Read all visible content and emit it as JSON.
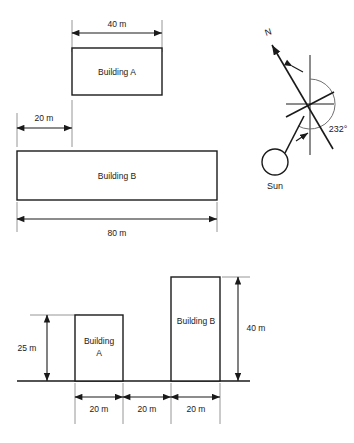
{
  "figure": {
    "title": "",
    "views": {
      "plan": {
        "name": "plan-view",
        "buildings": [
          {
            "id": "building-a",
            "label": "Building A",
            "width_label": "40 m",
            "x": 72,
            "y": 48,
            "w": 90,
            "h": 47
          },
          {
            "id": "building-b",
            "label": "Building B",
            "width_label": "80 m",
            "x": 17,
            "y": 151,
            "w": 200,
            "h": 49
          }
        ],
        "dimensions": [
          {
            "id": "plan-dim-40m",
            "label": "40 m",
            "x1": 72,
            "x2": 162,
            "y": 28
          },
          {
            "id": "plan-dim-offset-20m",
            "label": "20 m",
            "x1": 17,
            "x2": 72,
            "y": 128
          },
          {
            "id": "plan-dim-80m",
            "label": "80 m",
            "x1": 17,
            "x2": 217,
            "y": 222
          }
        ]
      },
      "elevation": {
        "name": "elevation-view",
        "ground_label": "",
        "ground": {
          "x1": 17,
          "x2": 250,
          "y": 381
        },
        "buildings": [
          {
            "id": "building-a-elev",
            "label_line1": "Building",
            "label_line2": "A",
            "height_label": "25 m",
            "x": 75,
            "y": 315,
            "w": 48,
            "h": 66
          },
          {
            "id": "building-b-elev",
            "label_line1": "Building B",
            "label_line2": "",
            "height_label": "40 m",
            "x": 171,
            "y": 277,
            "w": 49,
            "h": 104
          }
        ],
        "height_dims": [
          {
            "id": "elev-dim-25m",
            "label": "25 m",
            "x": 47,
            "y1": 315,
            "y2": 381
          },
          {
            "id": "elev-dim-40m",
            "label": "40 m",
            "x": 238,
            "y1": 277,
            "y2": 381
          }
        ],
        "width_dims": [
          {
            "id": "elev-dim-width-a",
            "label": "20 m",
            "x1": 75,
            "x2": 123,
            "y": 404
          },
          {
            "id": "elev-dim-gap",
            "label": "20 m",
            "x1": 123,
            "x2": 171,
            "y": 404
          },
          {
            "id": "elev-dim-width-b",
            "label": "20 m",
            "x1": 171,
            "x2": 220,
            "y": 404
          }
        ]
      },
      "compass": {
        "name": "compass-sun-diagram",
        "north_label": "N",
        "sun_label": "Sun",
        "angle_label": "232°",
        "center": {
          "x": 310,
          "y": 104
        },
        "arc_radius": 25,
        "north_arrow": {
          "tip_x": 268,
          "tip_y": 40
        },
        "sun_circle": {
          "cx": 275,
          "cy": 162,
          "r": 13
        }
      }
    },
    "colors": {
      "stroke": "#1a1a1a",
      "extension": "#8a8a8a",
      "arc": "#6f6f6f",
      "background": "#ffffff"
    }
  }
}
